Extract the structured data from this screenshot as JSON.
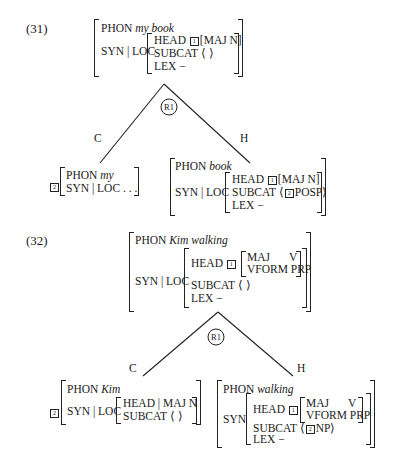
{
  "ex31": {
    "number": "(31)",
    "mother": {
      "phon_label": "PHON",
      "phon": "my book",
      "synloc": "SYN | LOC",
      "head_label": "HEAD",
      "head_tag": "1",
      "head_val": "[MAJ N]",
      "subcat_label": "SUBCAT",
      "subcat_val": "⟨   ⟩",
      "lex_label": "LEX",
      "lex_val": "−"
    },
    "rule": "R1",
    "left_branch": "C",
    "right_branch": "H",
    "comp": {
      "tag": "2",
      "phon_label": "PHON",
      "phon": "my",
      "synloc": "SYN | LOC . . ."
    },
    "head": {
      "phon_label": "PHON",
      "phon": "book",
      "synloc": "SYN | LOC",
      "head_label": "HEAD",
      "head_tag": "1",
      "head_val": "[MAJ N]",
      "subcat_label": "SUBCAT",
      "subcat_open": "⟨",
      "subcat_tag": "2",
      "subcat_val": "POSP⟩",
      "lex_label": "LEX",
      "lex_val": "−"
    }
  },
  "ex32": {
    "number": "(32)",
    "mother": {
      "phon_label": "PHON",
      "phon": "Kim walking",
      "synloc": "SYN | LOC",
      "head_label": "HEAD",
      "head_tag": "1",
      "maj_label": "MAJ",
      "maj_val": "V",
      "vform_label": "VFORM",
      "vform_val": "PRP",
      "subcat_label": "SUBCAT",
      "subcat_val": "⟨   ⟩",
      "lex_label": "LEX",
      "lex_val": "−"
    },
    "rule": "R1",
    "left_branch": "C",
    "right_branch": "H",
    "comp": {
      "tag": "2",
      "phon_label": "PHON",
      "phon": "Kim",
      "synloc": "SYN | LOC",
      "head_val": "HEAD | MAJ N",
      "subcat_label": "SUBCAT",
      "subcat_val": "⟨   ⟩"
    },
    "head": {
      "phon_label": "PHON",
      "phon": "walking",
      "syn": "SYN",
      "head_label": "HEAD",
      "head_tag": "1",
      "maj_label": "MAJ",
      "maj_val": "V",
      "vform_label": "VFORM",
      "vform_val": "PRP",
      "subcat_label": "SUBCAT",
      "subcat_open": "⟨",
      "subcat_tag": "2",
      "subcat_val": "NP⟩",
      "lex_label": "LEX",
      "lex_val": "−"
    }
  }
}
